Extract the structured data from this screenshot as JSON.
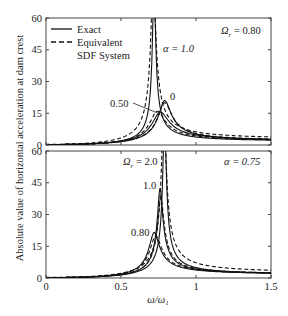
{
  "chart_data": [
    {
      "type": "line",
      "panel": "top",
      "annotation_top_right": "Ω_r = 0.80",
      "xlim": [
        0,
        1.5
      ],
      "ylim": [
        0,
        60
      ],
      "yticks": [
        "0",
        "15",
        "30",
        "45",
        "60"
      ],
      "xticks": [
        "0",
        "0.5",
        "1",
        "1.5"
      ],
      "legend": [
        {
          "label": "Exact",
          "style": "solid"
        },
        {
          "label": "Equivalent",
          "style": "dashed"
        },
        {
          "label": "SDF System",
          "style": "dashed-continued"
        }
      ],
      "curve_labels": [
        {
          "text": "α = 1.0",
          "x": 0.78,
          "y": 45
        },
        {
          "text": "0.50",
          "x": 0.62,
          "y": 19
        },
        {
          "text": "0",
          "x": 0.83,
          "y": 23
        }
      ],
      "series": [
        {
          "name": "α = 1.0 Exact",
          "style": "solid",
          "peak_x": 0.72,
          "peak_y": 80,
          "width": 0.012
        },
        {
          "name": "α = 1.0 Equivalent SDF",
          "style": "dashed",
          "peak_x": 0.715,
          "peak_y": 80,
          "width": 0.02
        },
        {
          "name": "α = 0.50 Exact",
          "style": "solid",
          "peak_x": 0.76,
          "peak_y": 15.5,
          "width": 0.07
        },
        {
          "name": "α = 0.50 Equivalent SDF",
          "style": "dashed",
          "peak_x": 0.74,
          "peak_y": 16,
          "width": 0.065
        },
        {
          "name": "α = 0 Exact",
          "style": "solid",
          "peak_x": 0.79,
          "peak_y": 21,
          "width": 0.05
        },
        {
          "name": "α = 0 Equivalent SDF",
          "style": "dashed",
          "peak_x": 0.79,
          "peak_y": 20,
          "width": 0.055
        }
      ]
    },
    {
      "type": "line",
      "panel": "bottom",
      "annotation_top_right": "α = 0.75",
      "xlabel": "ω/ω₁",
      "xlim": [
        0,
        1.5
      ],
      "ylim": [
        0,
        60
      ],
      "yticks": [
        "0",
        "15",
        "30",
        "45",
        "60"
      ],
      "xticks": [
        "0",
        "0.5",
        "1",
        "1.5"
      ],
      "curve_labels": [
        {
          "text": "Ω_r = 2.0",
          "x": 0.7,
          "y": 55
        },
        {
          "text": "1.0",
          "x": 0.69,
          "y": 43
        },
        {
          "text": "0.80",
          "x": 0.6,
          "y": 21
        }
      ],
      "series": [
        {
          "name": "Ω_r = 2.0 Exact",
          "style": "solid",
          "peak_x": 0.79,
          "peak_y": 80,
          "width": 0.012
        },
        {
          "name": "Ω_r = 2.0 Equivalent SDF",
          "style": "dashed",
          "peak_x": 0.785,
          "peak_y": 80,
          "width": 0.018
        },
        {
          "name": "Ω_r = 1.0 Exact",
          "style": "solid",
          "peak_x": 0.76,
          "peak_y": 42.5,
          "width": 0.022
        },
        {
          "name": "Ω_r = 1.0 Equivalent SDF",
          "style": "dashed",
          "peak_x": 0.765,
          "peak_y": 38,
          "width": 0.026
        },
        {
          "name": "Ω_r = 0.80 Exact",
          "style": "solid",
          "peak_x": 0.72,
          "peak_y": 21.5,
          "width": 0.045
        },
        {
          "name": "Ω_r = 0.80 Equivalent SDF",
          "style": "dashed",
          "peak_x": 0.73,
          "peak_y": 20,
          "width": 0.05
        }
      ]
    }
  ],
  "ylabel": "Absolute value of horizontal acceleration at dam crest",
  "xlabel": "ω/ω₁",
  "top": {
    "omega_label": "Ω",
    "omega_sub": "r",
    "omega_value": " = 0.80",
    "alpha_label": "α = 1.0",
    "label_050": "0.50",
    "label_0": "0",
    "legend_exact": "Exact",
    "legend_equiv": "Equivalent",
    "legend_sdf": "SDF System"
  },
  "bottom": {
    "alpha_label": "α = 0.75",
    "omega_label": "Ω",
    "omega_sub": "r",
    "omega_value": " = 2.0",
    "label_10": "1.0",
    "label_080": "0.80"
  },
  "ticks": {
    "y": [
      "0",
      "15",
      "30",
      "45",
      "60"
    ],
    "x": [
      "0",
      "0.5",
      "1",
      "1.5"
    ]
  }
}
